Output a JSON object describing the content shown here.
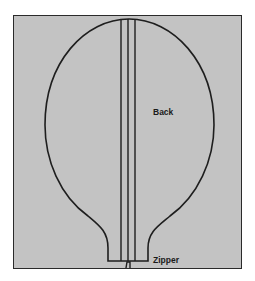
{
  "caption": "",
  "diagram": {
    "labels": {
      "back": "Back",
      "zipper": "Zipper"
    },
    "colors": {
      "panel": "#c3c3c3",
      "stroke": "#2a2a2a",
      "background": "#ffffff"
    }
  }
}
